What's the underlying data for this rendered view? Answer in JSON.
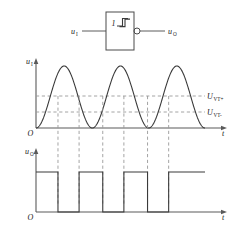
{
  "figure": {
    "stroke_color": "#3a3a3a",
    "dash_color": "#8a8a8a",
    "axis_color": "#555555"
  },
  "circuit": {
    "symbol_name": "schmitt-trigger-gate",
    "gate_marker": "1",
    "hysteresis_glyph": "hysteresis-symbol",
    "input_label": "u",
    "input_sub": "I",
    "output_label": "u",
    "output_sub": "O",
    "has_inverting_bubble": true
  },
  "plot_input": {
    "y_axis_label": "u",
    "y_axis_sub": "I",
    "x_axis_label": "t",
    "origin_label": "O",
    "threshold_upper_label": "U",
    "threshold_upper_sub": "VT+",
    "threshold_lower_label": "U",
    "threshold_lower_sub": "VT-"
  },
  "plot_output": {
    "y_axis_label": "u",
    "y_axis_sub": "O",
    "x_axis_label": "t",
    "origin_label": "O"
  },
  "chart_data": {
    "type": "line",
    "xlabel": "t",
    "ylabel": "u",
    "grid": false,
    "legend": null,
    "series": [
      {
        "name": "u_I",
        "type": "sine",
        "amplitude": 1.0,
        "offset": 1.0,
        "cycles": 3,
        "description": "rectified-looking sine starting at origin, three peaks"
      },
      {
        "name": "u_O",
        "type": "square",
        "high": 1.0,
        "low": 0.0,
        "description": "output high then low, toggling at threshold crossings"
      }
    ],
    "thresholds": [
      {
        "name": "U_VT+",
        "value": 0.62
      },
      {
        "name": "U_VT-",
        "value": 0.3
      }
    ],
    "crossing_fractions": [
      0.13,
      0.255,
      0.395,
      0.52,
      0.66,
      0.785
    ]
  }
}
